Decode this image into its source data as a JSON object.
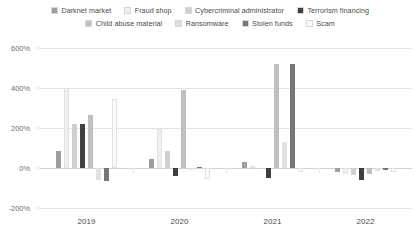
{
  "chart_data": {
    "type": "bar",
    "title": "",
    "xlabel": "",
    "ylabel": "",
    "categories": [
      "2019",
      "2020",
      "2021",
      "2022"
    ],
    "ylim": [
      -200,
      600
    ],
    "yticks": [
      600,
      400,
      200,
      0,
      -200
    ],
    "ytick_labels": [
      "600%",
      "400%",
      "200%",
      "0%",
      "-200%"
    ],
    "grid": true,
    "legend_position": "top",
    "value_suffix": "%",
    "series": [
      {
        "name": "Darknet market",
        "color": "#9e9e9e",
        "values": [
          85,
          45,
          30,
          -22
        ]
      },
      {
        "name": "Fraud shop",
        "color": "#efefef",
        "values": [
          400,
          195,
          12,
          -28
        ]
      },
      {
        "name": "Cybercriminal administrator",
        "color": "#cfcfcf",
        "values": [
          220,
          85,
          -5,
          -35
        ]
      },
      {
        "name": "Terrorism financing",
        "color": "#3f3f3f",
        "values": [
          222,
          -42,
          -48,
          -62
        ]
      },
      {
        "name": "Child abuse material",
        "color": "#bfbfbf",
        "values": [
          265,
          390,
          520,
          -30
        ]
      },
      {
        "name": "Ransomware",
        "color": "#e0e0e0",
        "values": [
          -60,
          -4,
          130,
          -15
        ]
      },
      {
        "name": "Stolen funds",
        "color": "#767676",
        "values": [
          -65,
          3,
          520,
          -12
        ]
      },
      {
        "name": "Scam",
        "color": "#fafafa",
        "values": [
          345,
          -55,
          -20,
          -20
        ]
      }
    ]
  },
  "legend": {
    "row1": [
      {
        "label": "Darknet market",
        "color": "#9e9e9e"
      },
      {
        "label": "Fraud shop",
        "color": "#efefef"
      },
      {
        "label": "Cybercriminal administrator",
        "color": "#cfcfcf"
      },
      {
        "label": "Terrorism financing",
        "color": "#3f3f3f"
      }
    ],
    "row2": [
      {
        "label": "Child abuse material",
        "color": "#bfbfbf"
      },
      {
        "label": "Ransomware",
        "color": "#e0e0e0"
      },
      {
        "label": "Stolen funds",
        "color": "#767676"
      },
      {
        "label": "Scam",
        "color": "#fafafa"
      }
    ]
  }
}
